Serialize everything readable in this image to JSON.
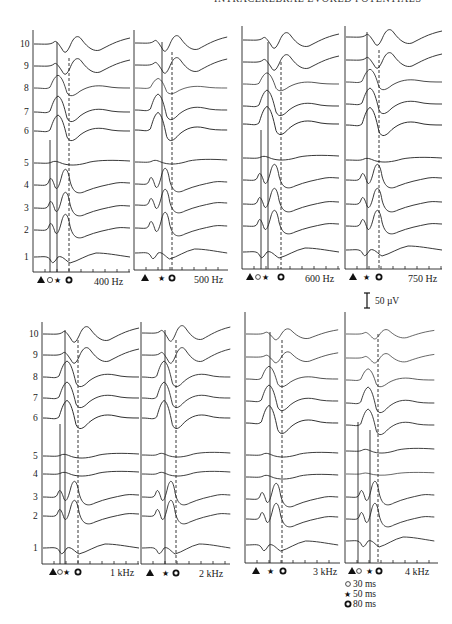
{
  "header": {
    "running_title": "INTRACEREBRAL EVOKED POTENTIALS"
  },
  "figure": {
    "trace_labels": [
      "1",
      "2",
      "3",
      "4",
      "5",
      "6",
      "7",
      "8",
      "9",
      "10"
    ],
    "panels": [
      {
        "id": "p400",
        "freq_label": "400 Hz",
        "markers": [
          "triangle",
          "open-circle",
          "star",
          "bold-circle"
        ]
      },
      {
        "id": "p500",
        "freq_label": "500 Hz",
        "markers": [
          "triangle",
          "star",
          "bold-circle"
        ]
      },
      {
        "id": "p600",
        "freq_label": "600 Hz",
        "markers": [
          "triangle",
          "open-circle",
          "star",
          "bold-circle"
        ]
      },
      {
        "id": "p750",
        "freq_label": "750 Hz",
        "markers": [
          "triangle",
          "star",
          "bold-circle"
        ]
      },
      {
        "id": "p1k",
        "freq_label": "1 kHz",
        "markers": [
          "triangle",
          "open-circle",
          "star",
          "bold-circle"
        ]
      },
      {
        "id": "p2k",
        "freq_label": "2 kHz",
        "markers": [
          "triangle",
          "star",
          "bold-circle"
        ]
      },
      {
        "id": "p3k",
        "freq_label": "3 kHz",
        "markers": [
          "triangle",
          "star",
          "bold-circle"
        ]
      },
      {
        "id": "p4k",
        "freq_label": "4 kHz",
        "markers": [
          "triangle",
          "open-circle",
          "star",
          "bold-circle"
        ]
      }
    ],
    "scale_bar": {
      "label": "50 µV"
    },
    "legend": [
      {
        "icon": "open-circle",
        "label": "30 ms"
      },
      {
        "icon": "star",
        "label": "50 ms"
      },
      {
        "icon": "bold-circle",
        "label": "80 ms"
      }
    ]
  }
}
